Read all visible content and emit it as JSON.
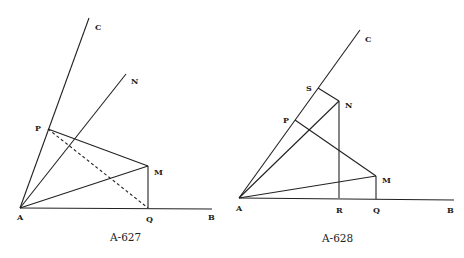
{
  "figures": [
    {
      "caption": "A-627",
      "points": {
        "A": {
          "label": "A"
        },
        "B": {
          "label": "B"
        },
        "C": {
          "label": "C"
        },
        "N": {
          "label": "N"
        },
        "P": {
          "label": "P"
        },
        "M": {
          "label": "M"
        },
        "Q": {
          "label": "Q"
        }
      },
      "segments": [
        "AB",
        "AC",
        "AN",
        "AM",
        "PM",
        "MQ",
        "PQ (dashed)"
      ]
    },
    {
      "caption": "A-628",
      "points": {
        "A": {
          "label": "A"
        },
        "B": {
          "label": "B"
        },
        "C": {
          "label": "C"
        },
        "S": {
          "label": "S"
        },
        "N": {
          "label": "N"
        },
        "P": {
          "label": "P"
        },
        "M": {
          "label": "M"
        },
        "R": {
          "label": "R"
        },
        "Q": {
          "label": "Q"
        }
      },
      "segments": [
        "AB",
        "AC",
        "AN",
        "AM",
        "SN",
        "NR",
        "PM",
        "MQ"
      ]
    }
  ],
  "colors": {
    "line": "#222222",
    "background": "#ffffff"
  }
}
